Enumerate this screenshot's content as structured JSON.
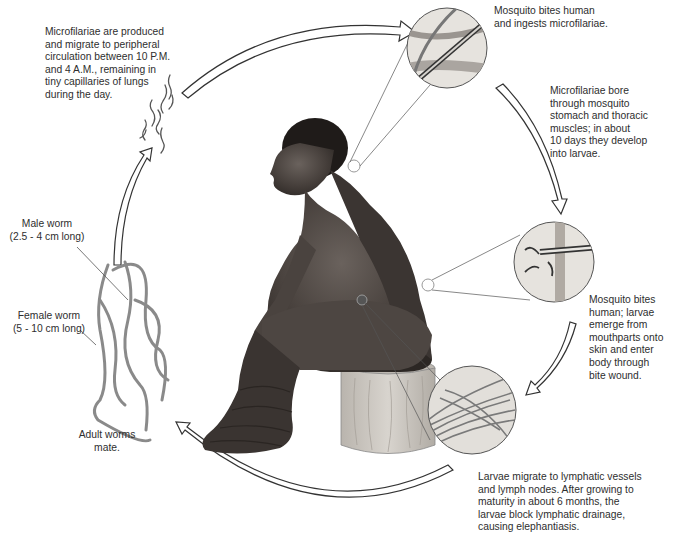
{
  "diagram": {
    "colors": {
      "background": "#ffffff",
      "text": "#2e2e2e",
      "arrow_stroke": "#333333",
      "skin_dark": "#3a3532",
      "skin_mid": "#5a5450",
      "stool": "#c9c4bd",
      "worm": "#8a8a8a",
      "inset_fill": "#e4e2df"
    },
    "stages": [
      {
        "id": "microfilariae-produced",
        "text": "Microfilariae are produced\nand migrate to peripheral\ncirculation between 10 P.M.\nand 4 A.M., remaining in\ntiny capillaries of lungs\nduring the day."
      },
      {
        "id": "mosquito-ingests",
        "text": "Mosquito bites human\nand ingests microfilariae."
      },
      {
        "id": "develop-into-larvae",
        "text": "Microfilariae bore\nthrough mosquito\nstomach and thoracic\nmuscles; in about\n10 days they develop\ninto larvae."
      },
      {
        "id": "larvae-enter-body",
        "text": "Mosquito bites\nhuman; larvae\nemerge from\nmouthparts onto\nskin and enter\nbody through\nbite wound."
      },
      {
        "id": "lymphatic-block",
        "text": "Larvae migrate to lymphatic vessels\nand lymph nodes. After growing to\nmaturity in about 6 months, the\nlarvae block lymphatic drainage,\ncausing elephantiasis."
      },
      {
        "id": "adult-worms-mate",
        "text": "Adult worms\nmate."
      }
    ],
    "worm_labels": {
      "male": "Male worm\n(2.5 - 4 cm long)",
      "female": "Female worm\n(5 - 10 cm long)"
    },
    "icons": {
      "cycle_arrows": "curved-block-arrow",
      "insets": "magnified-circle"
    }
  }
}
